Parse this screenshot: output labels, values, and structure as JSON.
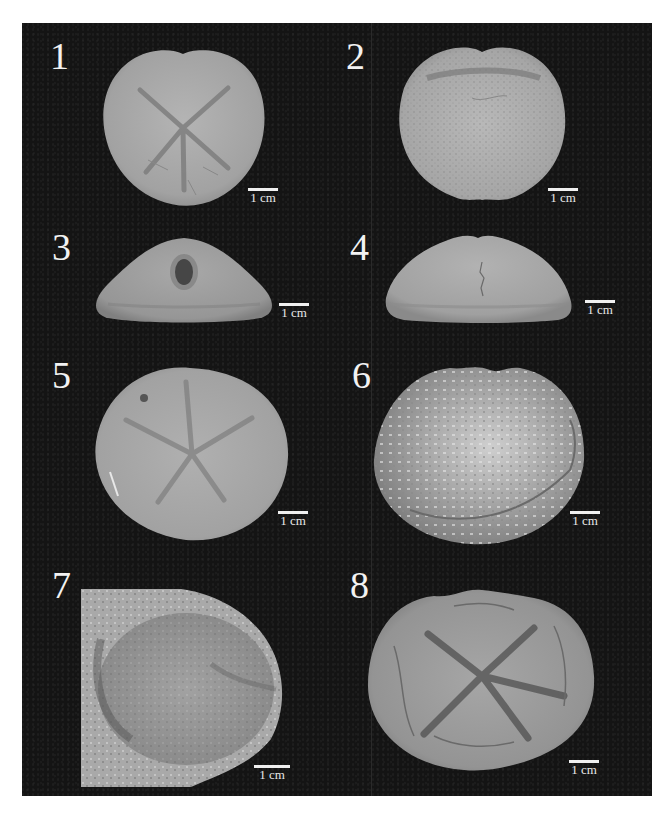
{
  "figure": {
    "background_color": "#141414",
    "label_color": "#f2f2f2",
    "panels": [
      {
        "number": "1",
        "scale_label": "1 cm",
        "view": "aboral view, heart-shaped test with petaloid ambulacra"
      },
      {
        "number": "2",
        "scale_label": "1 cm",
        "view": "oral view, heart-shaped test with tuberculate surface"
      },
      {
        "number": "3",
        "scale_label": "1 cm",
        "view": "posterior view, periproct visible"
      },
      {
        "number": "4",
        "scale_label": "1 cm",
        "view": "lateral view"
      },
      {
        "number": "5",
        "scale_label": "1 cm",
        "view": "aboral view, rounded test with petals"
      },
      {
        "number": "6",
        "scale_label": "1 cm",
        "view": "weathered specimen"
      },
      {
        "number": "7",
        "scale_label": "1 cm",
        "view": "specimen in rock matrix"
      },
      {
        "number": "8",
        "scale_label": "1 cm",
        "view": "aboral view, fractured test with petaloid ambulacra"
      }
    ]
  }
}
